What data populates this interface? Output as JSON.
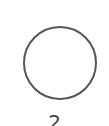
{
  "option": {
    "label": "2",
    "selected": false
  },
  "colors": {
    "circle_border": "#555555",
    "label": "#444444",
    "background": "#ffffff"
  }
}
